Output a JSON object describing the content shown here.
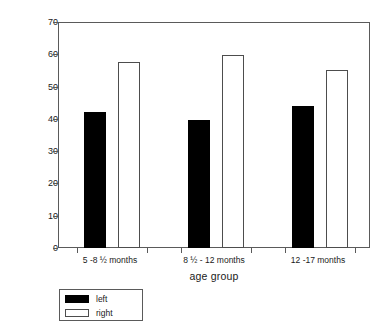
{
  "chart_data": {
    "type": "bar",
    "title": "",
    "xlabel": "age group",
    "ylabel": "% first looks to left or right",
    "categories": [
      "5 -8 ½ months",
      "8 ½ - 12 months",
      "12 -17 months"
    ],
    "series": [
      {
        "name": "left",
        "color": "#000000",
        "values": [
          42.0,
          39.7,
          44.0
        ]
      },
      {
        "name": "right",
        "color": "#ffffff",
        "values": [
          57.5,
          59.7,
          55.0
        ]
      }
    ],
    "ylim": [
      0,
      70
    ],
    "yticks": [
      0,
      10,
      20,
      30,
      40,
      50,
      60,
      70
    ],
    "ytick_labels": [
      "0",
      "10",
      "20",
      "30",
      "40",
      "50",
      "60",
      "70"
    ],
    "grid": false,
    "legend_position": "below-left",
    "frame": true
  },
  "legend": {
    "items": [
      {
        "label": "left"
      },
      {
        "label": "right"
      }
    ]
  }
}
